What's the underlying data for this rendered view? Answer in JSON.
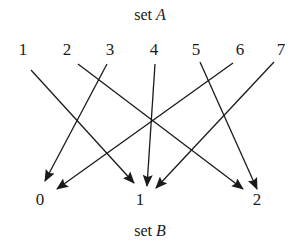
{
  "diagram": {
    "type": "function-mapping",
    "set_a": {
      "title_prefix": "set",
      "title_var": "A",
      "elements": [
        {
          "label": "1",
          "x": 23,
          "y": 50
        },
        {
          "label": "2",
          "x": 67,
          "y": 50
        },
        {
          "label": "3",
          "x": 110,
          "y": 50
        },
        {
          "label": "4",
          "x": 154,
          "y": 50
        },
        {
          "label": "5",
          "x": 196,
          "y": 50
        },
        {
          "label": "6",
          "x": 240,
          "y": 50
        },
        {
          "label": "7",
          "x": 281,
          "y": 50
        }
      ]
    },
    "set_b": {
      "title_prefix": "set",
      "title_var": "B",
      "elements": [
        {
          "label": "0",
          "x": 40,
          "y": 200
        },
        {
          "label": "1",
          "x": 140,
          "y": 200
        },
        {
          "label": "2",
          "x": 257,
          "y": 200
        }
      ]
    },
    "arrows": [
      {
        "from": "1",
        "to": "1",
        "x1": 31,
        "y1": 70,
        "x2": 134,
        "y2": 183
      },
      {
        "from": "2",
        "to": "2",
        "x1": 78,
        "y1": 64,
        "x2": 243,
        "y2": 189
      },
      {
        "from": "3",
        "to": "0",
        "x1": 107,
        "y1": 64,
        "x2": 45,
        "y2": 181
      },
      {
        "from": "4",
        "to": "1",
        "x1": 155,
        "y1": 64,
        "x2": 147,
        "y2": 186
      },
      {
        "from": "5",
        "to": "2",
        "x1": 200,
        "y1": 62,
        "x2": 257,
        "y2": 189
      },
      {
        "from": "6",
        "to": "0",
        "x1": 233,
        "y1": 63,
        "x2": 57,
        "y2": 189
      },
      {
        "from": "7",
        "to": "1",
        "x1": 274,
        "y1": 62,
        "x2": 156,
        "y2": 188
      }
    ],
    "stroke_color": "#1a1a1a"
  }
}
